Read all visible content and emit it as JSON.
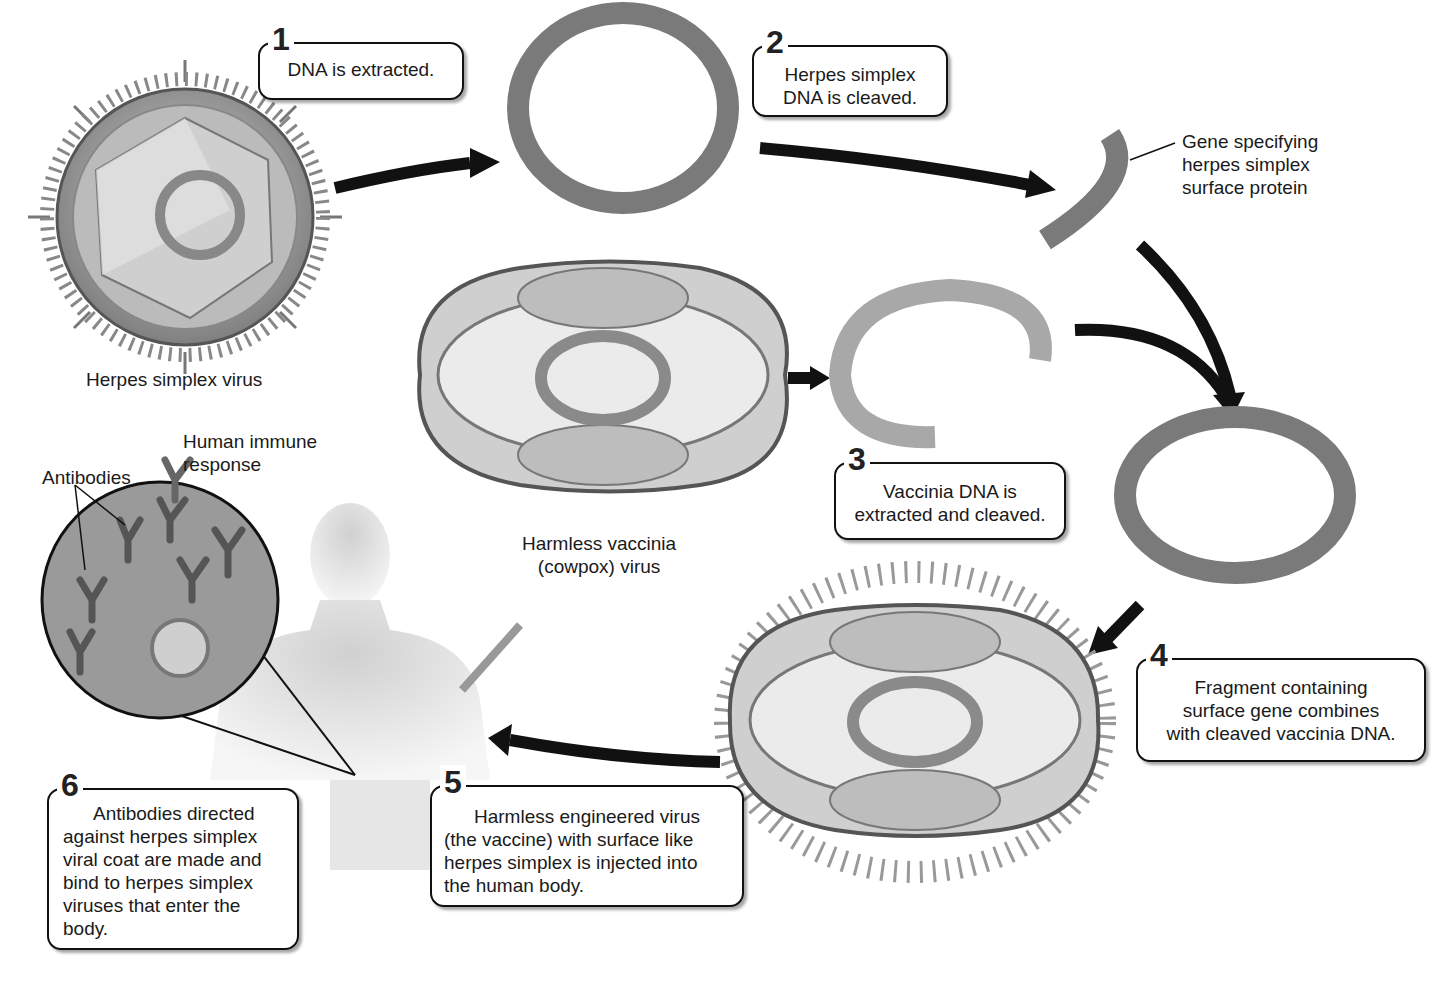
{
  "steps": [
    {
      "number": "1",
      "text": "DNA is extracted."
    },
    {
      "number": "2",
      "line1": "Herpes simplex",
      "line2": "DNA is cleaved."
    },
    {
      "number": "3",
      "line1": "Vaccinia DNA is",
      "line2": "extracted and cleaved."
    },
    {
      "number": "4",
      "line1": "Fragment containing",
      "line2": "surface gene combines",
      "line3": "with cleaved vaccinia DNA."
    },
    {
      "number": "5",
      "line1": "Harmless engineered virus",
      "line2": "(the vaccine) with surface like",
      "line3": "herpes simplex is injected into",
      "line4": "the human body."
    },
    {
      "number": "6",
      "line1": "Antibodies directed",
      "line2": "against herpes simplex",
      "line3": "viral coat are made and",
      "line4": "bind to herpes simplex",
      "line5": "viruses that enter the",
      "line6": "body."
    }
  ],
  "labels": {
    "herpes_virus": "Herpes simplex virus",
    "gene_line1": "Gene specifying",
    "gene_line2": "herpes simplex",
    "gene_line3": "surface protein",
    "vaccinia_line1": "Harmless vaccinia",
    "vaccinia_line2": "(cowpox) virus",
    "immune_line1": "Human immune",
    "immune_line2": "response",
    "antibodies": "Antibodies"
  },
  "colors": {
    "dna_ring": "#7a7a7a",
    "virus_shell": "#9a9a9a",
    "arrow": "#111111",
    "body": "#d9d9d9"
  }
}
